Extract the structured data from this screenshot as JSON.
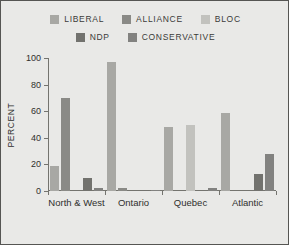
{
  "chart_data": {
    "type": "bar",
    "title": "",
    "xlabel": "",
    "ylabel": "PERCENT",
    "ylim": [
      0,
      100
    ],
    "yticks": [
      0,
      20,
      40,
      60,
      80,
      100
    ],
    "grid": false,
    "legend_position": "top",
    "categories": [
      "North & West",
      "Ontario",
      "Quebec",
      "Atlantic"
    ],
    "series": [
      {
        "name": "LIBERAL",
        "color": "#a8a8a4",
        "values": [
          19,
          97,
          48,
          59
        ]
      },
      {
        "name": "ALLIANCE",
        "color": "#8a8a86",
        "values": [
          70,
          2,
          0,
          0
        ]
      },
      {
        "name": "BLOC",
        "color": "#c2c2be",
        "values": [
          0,
          0,
          50,
          0
        ]
      },
      {
        "name": "NDP",
        "color": "#72726e",
        "values": [
          10,
          1,
          0,
          13
        ]
      },
      {
        "name": "CONSERVATIVE",
        "color": "#828280",
        "values": [
          2,
          1,
          2,
          28
        ]
      }
    ]
  },
  "legend": {
    "rows": [
      [
        "LIBERAL",
        "ALLIANCE",
        "BLOC"
      ],
      [
        "NDP",
        "CONSERVATIVE"
      ]
    ]
  },
  "axis": {
    "y_title": "PERCENT",
    "y_tick_labels": [
      "100",
      "80",
      "60",
      "40",
      "20",
      "0"
    ],
    "x_tick_labels": [
      "North & West",
      "Ontario",
      "Quebec",
      "Atlantic"
    ]
  },
  "colors": {
    "background": "#e9e9e7",
    "border": "#555553",
    "axis": "#74746f",
    "text": "#2f2f2d"
  }
}
